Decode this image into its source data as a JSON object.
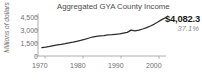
{
  "chart_data": {
    "type": "line",
    "title": "Aggregated GYA County Income",
    "xlabel": "",
    "ylabel": "Millions of dollars",
    "ylim": [
      0,
      4500
    ],
    "xlim": [
      1968,
      2001
    ],
    "grid": false,
    "legend": null,
    "ytick_labels": [
      "4,500",
      "3,000",
      "1,500",
      "0"
    ],
    "ytick_values": [
      4500,
      3000,
      1500,
      0
    ],
    "xtick_labels": [
      "1970",
      "1980",
      "1990",
      "2000"
    ],
    "xtick_values": [
      1970,
      1980,
      1990,
      2000
    ],
    "annotations": {
      "end_value": "$4,082.3",
      "end_percent": "37.1%"
    },
    "series": [
      {
        "name": "Aggregated GYA County Income",
        "color": "#2b2b2b",
        "x": [
          1969,
          1970,
          1971,
          1972,
          1973,
          1974,
          1975,
          1976,
          1977,
          1978,
          1979,
          1980,
          1981,
          1982,
          1983,
          1984,
          1985,
          1986,
          1987,
          1988,
          1989,
          1990,
          1991,
          1992,
          1993,
          1994,
          1995,
          1996,
          1997,
          1998,
          1999,
          2000,
          2001
        ],
        "values": [
          880,
          940,
          1010,
          1090,
          1170,
          1230,
          1300,
          1380,
          1460,
          1550,
          1650,
          1760,
          1880,
          2010,
          2080,
          2120,
          2160,
          2230,
          2260,
          2300,
          2340,
          2420,
          2500,
          2740,
          2660,
          2740,
          2860,
          3000,
          3180,
          3380,
          3620,
          3880,
          4082.3
        ]
      }
    ]
  }
}
